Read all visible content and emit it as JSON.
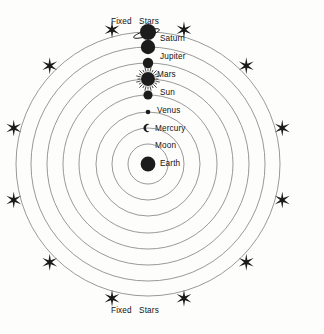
{
  "diagram": {
    "caption_top": "Fixed   Stars",
    "caption_bottom": "Fixed   Stars",
    "center_x": 148,
    "center_y": 164,
    "background_color": "#fdfdfc",
    "orbit_color": "#8d8d8d",
    "ink_color": "#1c1c1c"
  },
  "chart_data": {
    "type": "diagram",
    "center_body": "Earth",
    "orbit_count": 8,
    "orbit_radii": [
      20,
      36,
      52,
      69,
      85,
      101,
      117,
      132
    ],
    "star_count": 12,
    "star_ring_radius": 139,
    "star_angles_deg": [
      255,
      285,
      225,
      315,
      195,
      345,
      165,
      15,
      135,
      45,
      105,
      75
    ],
    "bodies": [
      {
        "name": "Saturn",
        "orbit_index": 8,
        "radius": 132,
        "marker": "ringed-disc",
        "size": 8.0,
        "label_x": 160,
        "label_y": 39
      },
      {
        "name": "Jupiter",
        "orbit_index": 7,
        "radius": 117,
        "marker": "disc",
        "size": 7.2,
        "label_x": 160,
        "label_y": 57
      },
      {
        "name": "Mars",
        "orbit_index": 6,
        "radius": 101,
        "marker": "disc",
        "size": 5.2,
        "label_x": 157,
        "label_y": 75
      },
      {
        "name": "Sun",
        "orbit_index": 5,
        "radius": 85,
        "marker": "rayed-disc",
        "size": 7.0,
        "label_x": 160,
        "label_y": 93
      },
      {
        "name": "Venus",
        "orbit_index": 4,
        "radius": 69,
        "marker": "disc",
        "size": 4.6,
        "label_x": 157,
        "label_y": 111
      },
      {
        "name": "Mercury",
        "orbit_index": 3,
        "radius": 52,
        "marker": "disc",
        "size": 2.3,
        "label_x": 155,
        "label_y": 129
      },
      {
        "name": "Moon",
        "orbit_index": 2,
        "radius": 36,
        "marker": "crescent",
        "size": 3.6,
        "label_x": 155,
        "label_y": 146
      },
      {
        "name": "Earth",
        "orbit_index": 0,
        "radius": 0,
        "marker": "disc",
        "size": 7.4,
        "label_x": 160,
        "label_y": 164
      }
    ]
  },
  "labels": {
    "saturn": "Saturn",
    "jupiter": "Jupiter",
    "mars": "Mars",
    "sun": "Sun",
    "venus": "Venus",
    "mercury": "Mercury",
    "moon": "Moon",
    "earth": "Earth"
  }
}
